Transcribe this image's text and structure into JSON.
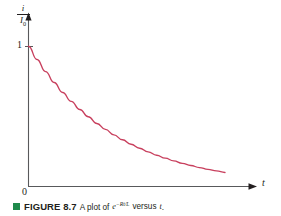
{
  "figure": {
    "caption_bullet_color": "#1f8a4c",
    "caption_label": "FIGURE 8.7",
    "caption_text_before": "A plot of",
    "caption_math_base": "e",
    "caption_math_exponent": "−Rt/L",
    "caption_text_middle": "versus",
    "caption_math_variable": "t",
    "caption_text_end": "."
  },
  "chart_data": {
    "type": "line",
    "title": "",
    "subtitle": "",
    "xlabel": "t",
    "ylabel_numerator": "i",
    "ylabel_denominator": "I",
    "ylabel_denominator_sub": "0",
    "ylabel": "i/I0",
    "function": "e^(-Rt/L)",
    "grid": false,
    "legend": "none",
    "xlim": [
      0,
      5
    ],
    "ylim": [
      0,
      1.15
    ],
    "x_tick_labels": [
      "0"
    ],
    "y_tick_labels": [
      "1"
    ],
    "curve_color": "#c8405e",
    "axis_color": "#58595b",
    "series": [
      {
        "name": "e^(-Rt/L)",
        "x": [
          0.0,
          0.2,
          0.4,
          0.6,
          0.8,
          1.0,
          1.2,
          1.4,
          1.6,
          1.8,
          2.0,
          2.2,
          2.4,
          2.6,
          2.8,
          3.0,
          3.2,
          3.4,
          3.6,
          3.8,
          4.0,
          4.2,
          4.4,
          4.6
        ],
        "y": [
          1.0,
          0.905,
          0.819,
          0.741,
          0.67,
          0.607,
          0.549,
          0.497,
          0.449,
          0.407,
          0.368,
          0.333,
          0.301,
          0.273,
          0.247,
          0.223,
          0.202,
          0.183,
          0.165,
          0.15,
          0.135,
          0.122,
          0.111,
          0.1
        ]
      }
    ]
  }
}
